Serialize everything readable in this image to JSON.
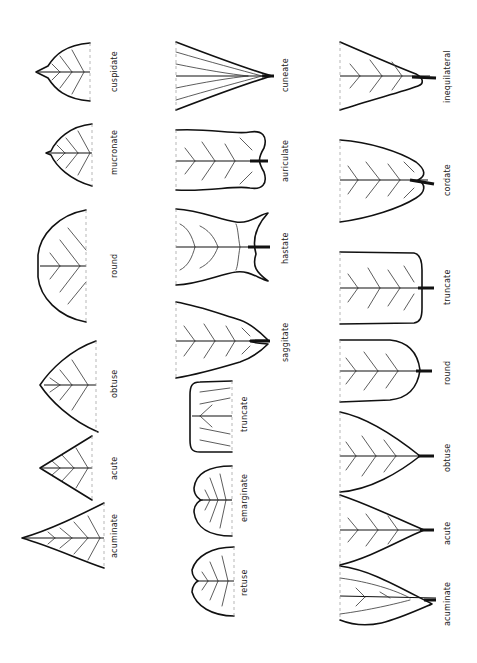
{
  "groups": {
    "apex_pointed": {
      "labels": [
        "acuminate",
        "acute",
        "obtuse",
        "round",
        "mucronate",
        "cuspidate"
      ]
    },
    "apex_notched": {
      "labels": [
        "retuse",
        "emarginate",
        "truncate"
      ]
    },
    "base_lobed": {
      "labels": [
        "saggitate",
        "hastate",
        "auriculate",
        "cuneate"
      ]
    },
    "base_shapes": {
      "labels": [
        "acuminate",
        "acute",
        "obtuse",
        "round",
        "truncate",
        "cordate",
        "inequilateral"
      ]
    }
  },
  "colors": {
    "ink": "#111111",
    "background": "#ffffff",
    "guide": "#999999"
  }
}
